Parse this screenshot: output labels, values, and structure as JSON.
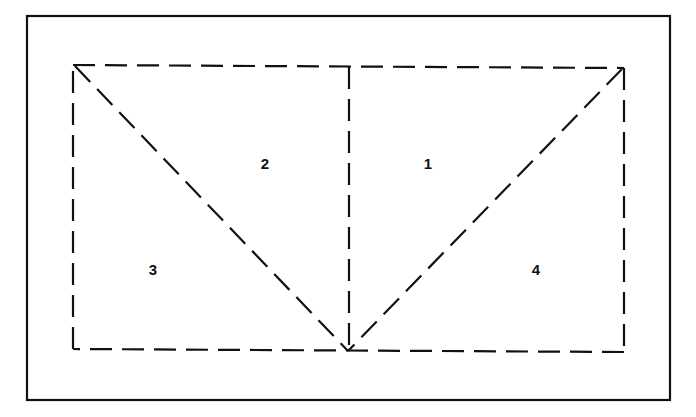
{
  "diagram": {
    "regions": [
      {
        "id": "region-1",
        "label": "1"
      },
      {
        "id": "region-2",
        "label": "2"
      },
      {
        "id": "region-3",
        "label": "3"
      },
      {
        "id": "region-4",
        "label": "4"
      }
    ],
    "line_style": "dashed",
    "stroke_color": "#111111",
    "background_color": "#ffffff"
  }
}
